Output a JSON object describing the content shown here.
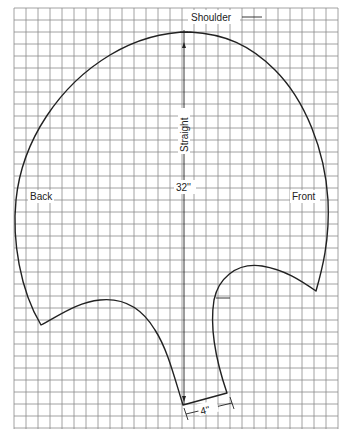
{
  "diagram": {
    "type": "sewing-pattern",
    "grid": {
      "left": 14,
      "top": 8,
      "right": 338,
      "bottom": 429,
      "cell": 12,
      "color": "#8a8a8a"
    },
    "labels": {
      "shoulder": "Shoulder",
      "straight": "Straight",
      "length": "32''",
      "back": "Back",
      "front": "Front",
      "width": "4''"
    },
    "colors": {
      "outline": "#222222",
      "background": "#ffffff"
    }
  }
}
